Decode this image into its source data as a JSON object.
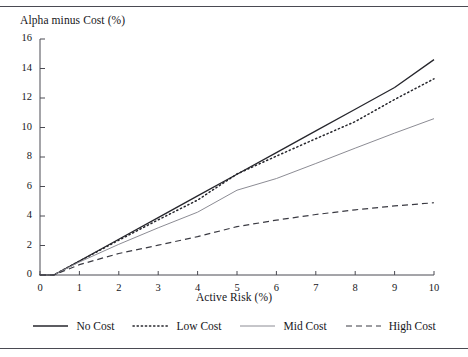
{
  "figure": {
    "top_rule": "horizontal-rule",
    "bottom_rule": "horizontal-rule"
  },
  "chart_data": {
    "type": "line",
    "title": "",
    "ylabel": "Alpha minus Cost (%)",
    "xlabel": "Active Risk (%)",
    "xlim": [
      0,
      10
    ],
    "ylim": [
      0,
      16
    ],
    "xticks": [
      "0",
      "1",
      "2",
      "3",
      "4",
      "5",
      "6",
      "7",
      "8",
      "9",
      "10"
    ],
    "yticks": [
      "0",
      "2",
      "4",
      "6",
      "8",
      "10",
      "12",
      "14",
      "16"
    ],
    "grid": false,
    "legend_position": "bottom",
    "x": [
      0,
      0.35,
      1,
      2,
      3,
      4,
      5,
      6,
      7,
      8,
      9,
      10
    ],
    "series": [
      {
        "name": "No Cost",
        "style": "solid",
        "color": "#26262c",
        "width": 1.3,
        "values": [
          0,
          0,
          0.95,
          2.42,
          3.89,
          5.36,
          6.83,
          8.3,
          9.77,
          11.24,
          12.71,
          14.6
        ]
      },
      {
        "name": "Low Cost",
        "style": "dotted",
        "color": "#26262c",
        "width": 1.5,
        "values": [
          0,
          0,
          0.94,
          2.36,
          3.74,
          5.08,
          6.85,
          8.06,
          9.24,
          10.4,
          11.9,
          13.3
        ]
      },
      {
        "name": "Mid Cost",
        "style": "solid",
        "color": "#8c8c94",
        "width": 1.0,
        "values": [
          0,
          0,
          0.88,
          2.08,
          3.2,
          4.26,
          5.75,
          6.54,
          7.56,
          8.6,
          9.62,
          10.6
        ]
      },
      {
        "name": "High Cost",
        "style": "dashed",
        "color": "#3a3a42",
        "width": 1.2,
        "values": [
          0,
          0,
          0.7,
          1.46,
          2.02,
          2.6,
          3.28,
          3.72,
          4.1,
          4.42,
          4.68,
          4.9
        ]
      }
    ]
  },
  "legend": {
    "items": [
      {
        "label": "No Cost",
        "style": "solid",
        "color": "#26262c"
      },
      {
        "label": "Low Cost",
        "style": "dotted",
        "color": "#26262c"
      },
      {
        "label": "Mid Cost",
        "style": "solid",
        "color": "#8c8c94"
      },
      {
        "label": "High Cost",
        "style": "dashed",
        "color": "#3a3a42"
      }
    ]
  }
}
